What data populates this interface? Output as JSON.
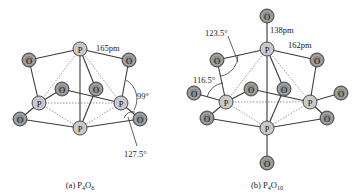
{
  "figure": {
    "panels": [
      {
        "id": "a",
        "caption_prefix": "(a) ",
        "formula": [
          {
            "t": "P"
          },
          {
            "s": "4"
          },
          {
            "t": "O"
          },
          {
            "s": "6"
          }
        ],
        "annotations": {
          "bond_length": "165pm",
          "angle_1": "99°",
          "angle_2": "127.5°"
        },
        "atom_labels": {
          "P": "P",
          "O": "O"
        }
      },
      {
        "id": "b",
        "caption_prefix": "(b) ",
        "formula": [
          {
            "t": "P"
          },
          {
            "s": "4"
          },
          {
            "t": "O"
          },
          {
            "s": "10"
          }
        ],
        "annotations": {
          "terminal_bond_length": "138pm",
          "bridge_bond_length": "162pm",
          "angle_1": "123.5°",
          "angle_2": "116.5°"
        },
        "atom_labels": {
          "P": "P",
          "O": "O"
        }
      }
    ],
    "colors": {
      "phosphorus": "#c9c9c9",
      "oxygen": "#8c8c8c",
      "bond": "#3a3a3a"
    }
  }
}
